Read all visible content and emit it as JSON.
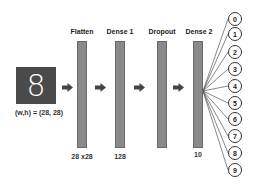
{
  "input": {
    "digit": "8",
    "label": "(w,h) = (28, 28)",
    "color": "#4a4a4a"
  },
  "layers": [
    {
      "title": "Flatten",
      "size": "28 x28"
    },
    {
      "title": "Dense 1",
      "size": "128"
    },
    {
      "title": "Dropout",
      "size": ""
    },
    {
      "title": "Dense 2",
      "size": "10"
    }
  ],
  "outputs": [
    "0",
    "1",
    "2",
    "3",
    "4",
    "5",
    "6",
    "7",
    "8",
    "9"
  ],
  "colors": {
    "bar": "#8a8a8a",
    "arrow": "#444444",
    "line": "#555555"
  }
}
